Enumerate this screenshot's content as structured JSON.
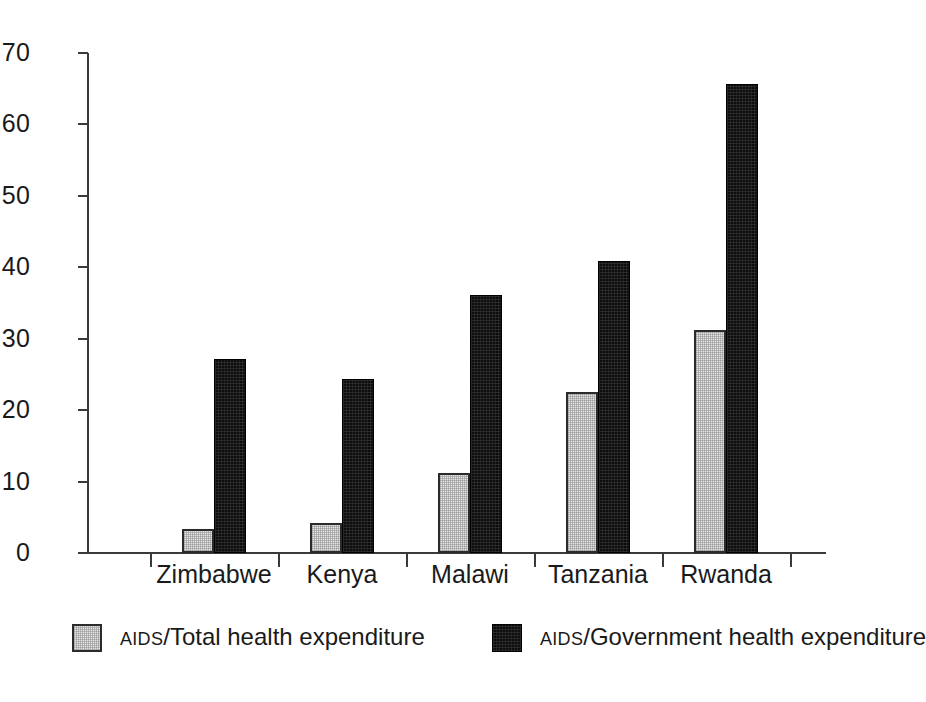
{
  "chart_data": {
    "type": "bar",
    "title": "",
    "subtitle": "",
    "xlabel": "",
    "ylabel": "",
    "ylim": [
      0,
      70
    ],
    "ytick_step": 10,
    "yticks": [
      0,
      10,
      20,
      30,
      40,
      50,
      60,
      70
    ],
    "grid": false,
    "legend_position": "bottom",
    "categories": [
      "Zimbabwe",
      "Kenya",
      "Malawi",
      "Tanzania",
      "Rwanda"
    ],
    "series": [
      {
        "name": "AIDS/Total health expenditure",
        "name_prefix": "AIDS",
        "name_rest": "/Total health expenditure",
        "color": "#e4e4e4",
        "swatch": "light",
        "values": [
          3.3,
          4.2,
          11.2,
          22.6,
          31.2
        ]
      },
      {
        "name": "AIDS/Government health expenditure",
        "name_prefix": "AIDS",
        "name_rest": "/Government health expenditure",
        "color": "#0d0d0d",
        "swatch": "dark",
        "values": [
          27.2,
          24.4,
          36.1,
          40.9,
          65.6
        ]
      }
    ]
  }
}
